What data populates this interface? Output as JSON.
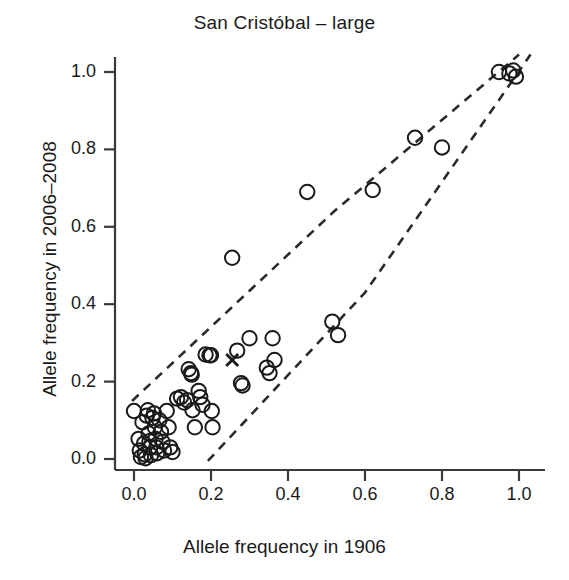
{
  "chart_data": {
    "type": "scatter",
    "title": "San Cristóbal – large",
    "xlabel": "Allele frequency in 1906",
    "ylabel": "Allele frequency in 2006–2008",
    "xlim": [
      0.0,
      1.0
    ],
    "ylim": [
      0.0,
      1.0
    ],
    "xticks": [
      0.0,
      0.2,
      0.4,
      0.6,
      0.8,
      1.0
    ],
    "yticks": [
      0.0,
      0.2,
      0.4,
      0.6,
      0.8,
      1.0
    ],
    "xticklabels": [
      "0.0",
      "0.2",
      "0.4",
      "0.6",
      "0.8",
      "1.0"
    ],
    "yticklabels": [
      "0.0",
      "0.2",
      "0.4",
      "0.6",
      "0.8",
      "1.0"
    ],
    "grid": false,
    "legend": null,
    "series": [
      {
        "name": "Allele frequencies",
        "marker": "open-circle",
        "color": "#1a1a1a",
        "points": [
          [
            0.0,
            0.124
          ],
          [
            0.012,
            0.052
          ],
          [
            0.015,
            0.022
          ],
          [
            0.018,
            0.005
          ],
          [
            0.022,
            0.095
          ],
          [
            0.026,
            0.04
          ],
          [
            0.028,
            0.012
          ],
          [
            0.03,
            0.002
          ],
          [
            0.033,
            0.112
          ],
          [
            0.036,
            0.126
          ],
          [
            0.038,
            0.066
          ],
          [
            0.04,
            0.046
          ],
          [
            0.042,
            0.03
          ],
          [
            0.044,
            0.01
          ],
          [
            0.048,
            0.106
          ],
          [
            0.052,
            0.118
          ],
          [
            0.054,
            0.082
          ],
          [
            0.056,
            0.052
          ],
          [
            0.058,
            0.03
          ],
          [
            0.06,
            0.015
          ],
          [
            0.066,
            0.1
          ],
          [
            0.07,
            0.07
          ],
          [
            0.074,
            0.044
          ],
          [
            0.078,
            0.022
          ],
          [
            0.085,
            0.124
          ],
          [
            0.09,
            0.082
          ],
          [
            0.094,
            0.03
          ],
          [
            0.1,
            0.018
          ],
          [
            0.112,
            0.156
          ],
          [
            0.122,
            0.16
          ],
          [
            0.13,
            0.146
          ],
          [
            0.138,
            0.152
          ],
          [
            0.142,
            0.232
          ],
          [
            0.148,
            0.222
          ],
          [
            0.15,
            0.218
          ],
          [
            0.152,
            0.126
          ],
          [
            0.158,
            0.082
          ],
          [
            0.168,
            0.176
          ],
          [
            0.172,
            0.16
          ],
          [
            0.178,
            0.14
          ],
          [
            0.186,
            0.27
          ],
          [
            0.196,
            0.268
          ],
          [
            0.2,
            0.268
          ],
          [
            0.202,
            0.124
          ],
          [
            0.204,
            0.082
          ],
          [
            0.255,
            0.52
          ],
          [
            0.268,
            0.28
          ],
          [
            0.278,
            0.196
          ],
          [
            0.282,
            0.19
          ],
          [
            0.3,
            0.312
          ],
          [
            0.345,
            0.236
          ],
          [
            0.352,
            0.222
          ],
          [
            0.36,
            0.312
          ],
          [
            0.365,
            0.256
          ],
          [
            0.45,
            0.69
          ],
          [
            0.515,
            0.355
          ],
          [
            0.53,
            0.32
          ],
          [
            0.62,
            0.695
          ],
          [
            0.73,
            0.83
          ],
          [
            0.8,
            0.805
          ],
          [
            0.948,
            1.0
          ],
          [
            0.975,
            0.996
          ],
          [
            0.985,
            1.004
          ],
          [
            0.992,
            0.988
          ]
        ]
      },
      {
        "name": "Marked locus",
        "marker": "x-cross",
        "color": "#1a1a1a",
        "points": [
          [
            0.255,
            0.256
          ]
        ]
      }
    ],
    "annotations": [
      {
        "name": "upper-confidence-boundary",
        "style": "dashed",
        "points": [
          [
            -0.005,
            0.15
          ],
          [
            0.52,
            0.64
          ],
          [
            1.0,
            1.045
          ]
        ]
      },
      {
        "name": "lower-confidence-boundary",
        "style": "dashed",
        "points": [
          [
            0.192,
            -0.005
          ],
          [
            0.6,
            0.43
          ],
          [
            1.03,
            1.045
          ]
        ]
      }
    ]
  }
}
